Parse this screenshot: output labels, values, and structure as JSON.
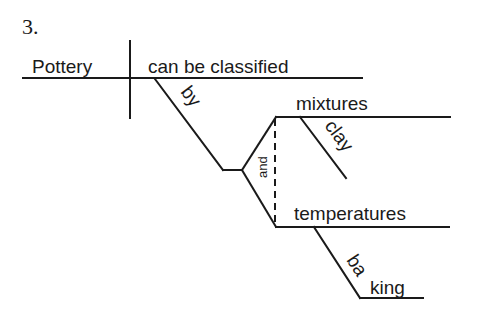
{
  "problem": {
    "number": "3."
  },
  "diagram": {
    "type": "sentence-diagram",
    "subject": "Pottery",
    "verb": "can be classified",
    "preposition": "by",
    "conjunction": "and",
    "objects": [
      {
        "word": "mixtures",
        "modifier": "clay"
      },
      {
        "word": "temperatures",
        "modifier": "baking"
      }
    ]
  }
}
